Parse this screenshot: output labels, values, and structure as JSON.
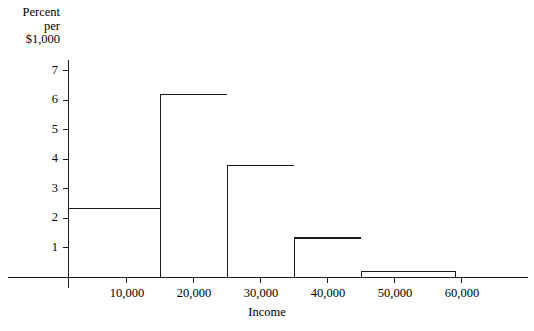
{
  "figure": {
    "background": "#ffffff",
    "line_color": "#1a1a1a"
  },
  "axes": {
    "y_title_line1": "Percent",
    "y_title_line2": "per",
    "y_title_line3": "$1,000",
    "x_title": "Income",
    "y_ticks": [
      "1",
      "2",
      "3",
      "4",
      "5",
      "6",
      "7"
    ],
    "x_ticks": [
      "10,000",
      "20,000",
      "30,000",
      "40,000",
      "50,000",
      "60,000"
    ]
  },
  "chart_data": {
    "type": "bar",
    "title": "",
    "subtitle": "",
    "xlabel": "Income",
    "ylabel": "Percent per $1,000",
    "xlim": [
      0,
      67000
    ],
    "ylim": [
      0,
      7.4
    ],
    "grid": false,
    "legend": false,
    "histogram": true,
    "bin_edges": [
      1200,
      15000,
      25000,
      35000,
      45000,
      59000
    ],
    "bin_labels": [
      "1,200-15,000",
      "15,000-25,000",
      "25,000-35,000",
      "35,000-45,000",
      "45,000-59,000"
    ],
    "values": [
      2.33,
      6.2,
      3.77,
      1.32,
      0.2
    ],
    "xtick_values": [
      10000,
      20000,
      30000,
      40000,
      50000,
      60000
    ],
    "xtick_labels": [
      "10,000",
      "20,000",
      "30,000",
      "40,000",
      "50,000",
      "60,000"
    ],
    "ytick_values": [
      1,
      2,
      3,
      4,
      5,
      6,
      7
    ],
    "ytick_labels": [
      "1",
      "2",
      "3",
      "4",
      "5",
      "6",
      "7"
    ]
  }
}
